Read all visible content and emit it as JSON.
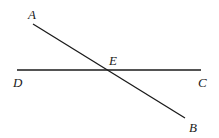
{
  "diagram": {
    "type": "intersecting-lines",
    "points": {
      "A": {
        "label": "A",
        "x": 33,
        "y": 24
      },
      "B": {
        "label": "B",
        "x": 185,
        "y": 118
      },
      "C": {
        "label": "C",
        "x": 201,
        "y": 70
      },
      "D": {
        "label": "D",
        "x": 17,
        "y": 70
      },
      "E": {
        "label": "E",
        "x": 107,
        "y": 70
      }
    },
    "segments": [
      {
        "name": "AB",
        "from": "A",
        "to": "B"
      },
      {
        "name": "DC",
        "from": "D",
        "to": "C"
      }
    ],
    "intersection": "E",
    "line_color": "#1a1a1a"
  }
}
